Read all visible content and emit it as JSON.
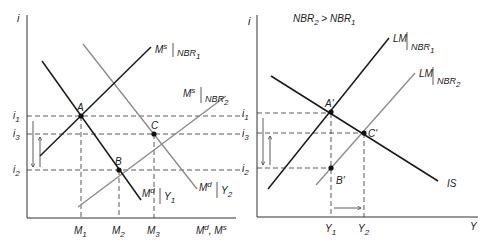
{
  "colors": {
    "black_line": "#1a1a1a",
    "gray_line": "#8a8a8a",
    "dash": "#333333",
    "background": "#ffffff"
  },
  "left_panel": {
    "y_axis_label": "i",
    "x_axis_label": "M",
    "x_axis_label_sup1": "d",
    "x_axis_label_sep": ", M",
    "x_axis_label_sup2": "s",
    "y_ticks": [
      {
        "base": "i",
        "sub": "1"
      },
      {
        "base": "i",
        "sub": "3"
      },
      {
        "base": "i",
        "sub": "2"
      }
    ],
    "x_ticks": [
      {
        "base": "M",
        "sub": "1"
      },
      {
        "base": "M",
        "sub": "2"
      },
      {
        "base": "M",
        "sub": "3"
      }
    ],
    "points": [
      "A",
      "B",
      "C"
    ],
    "curves": {
      "ms_nbr1": {
        "base": "M",
        "sup": "s",
        "cond": "NBR",
        "sub": "1"
      },
      "ms_nbr2": {
        "base": "M",
        "sup": "s",
        "cond": "NBR",
        "sub": "2"
      },
      "md_y1": {
        "base": "M",
        "sup": "d",
        "cond": "Y",
        "sub": "1"
      },
      "md_y2": {
        "base": "M",
        "sup": "d",
        "cond": "Y",
        "sub": "2"
      }
    }
  },
  "right_panel": {
    "title": {
      "a": "NBR",
      "a_sub": "2",
      "op": " > ",
      "b": "NBR",
      "b_sub": "1"
    },
    "y_axis_label": "i",
    "x_axis_label": "Y",
    "y_ticks": [
      {
        "base": "i",
        "sub": "1"
      },
      {
        "base": "i",
        "sub": "3"
      },
      {
        "base": "i",
        "sub": "2"
      }
    ],
    "x_ticks": [
      {
        "base": "Y",
        "sub": "1"
      },
      {
        "base": "Y",
        "sub": "2"
      }
    ],
    "points": [
      "A'",
      "B'",
      "C'"
    ],
    "curves": {
      "lm_nbr1": {
        "base": "LM",
        "cond": "NBR",
        "sub": "1"
      },
      "lm_nbr2": {
        "base": "LM",
        "cond": "NBR",
        "sub": "2"
      },
      "is": "IS"
    }
  }
}
